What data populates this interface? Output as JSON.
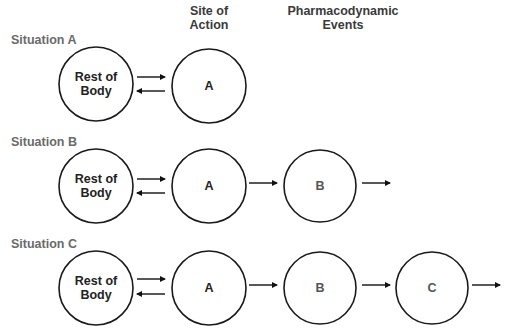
{
  "headers": {
    "site_of_action_line1": "Site of",
    "site_of_action_line2": "Action",
    "pd_events_line1": "Pharmacodynamic",
    "pd_events_line2": "Events"
  },
  "situations": [
    {
      "label": "Situation A",
      "nodes": [
        {
          "id": "rest",
          "line1": "Rest of",
          "line2": "Body"
        },
        {
          "id": "A",
          "label": "A"
        }
      ],
      "connections": [
        "rest<->A"
      ]
    },
    {
      "label": "Situation B",
      "nodes": [
        {
          "id": "rest",
          "line1": "Rest of",
          "line2": "Body"
        },
        {
          "id": "A",
          "label": "A"
        },
        {
          "id": "B",
          "label": "B"
        }
      ],
      "connections": [
        "rest<->A",
        "A->B",
        "B->out"
      ]
    },
    {
      "label": "Situation C",
      "nodes": [
        {
          "id": "rest",
          "line1": "Rest of",
          "line2": "Body"
        },
        {
          "id": "A",
          "label": "A"
        },
        {
          "id": "B",
          "label": "B"
        },
        {
          "id": "C",
          "label": "C"
        }
      ],
      "connections": [
        "rest<->A",
        "A->B",
        "B->C",
        "C->out"
      ]
    }
  ],
  "colors": {
    "stroke": "#1a1a1a",
    "situation_label": "#6a6a6a",
    "header": "#3a3a3a"
  }
}
